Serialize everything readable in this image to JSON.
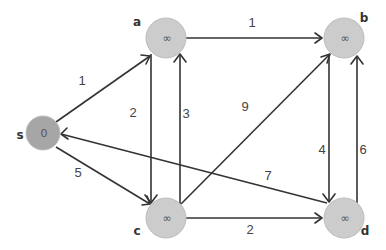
{
  "diagram": {
    "type": "directed-weighted-graph",
    "colors": {
      "source_node": "#a6a6a6",
      "node": "#cccccc",
      "edge": "#333333"
    },
    "nodes": [
      {
        "id": "s",
        "label": "s",
        "value": "0",
        "x": 43,
        "y": 133,
        "r": 17
      },
      {
        "id": "a",
        "label": "a",
        "value": "∞",
        "x": 166,
        "y": 38,
        "r": 20
      },
      {
        "id": "b",
        "label": "b",
        "value": "∞",
        "x": 344,
        "y": 38,
        "r": 20
      },
      {
        "id": "c",
        "label": "c",
        "value": "∞",
        "x": 166,
        "y": 218,
        "r": 20
      },
      {
        "id": "d",
        "label": "d",
        "value": "∞",
        "x": 344,
        "y": 218,
        "r": 20
      }
    ],
    "edges": [
      {
        "from": "s",
        "to": "a",
        "weight": "1"
      },
      {
        "from": "s",
        "to": "c",
        "weight": "5"
      },
      {
        "from": "a",
        "to": "b",
        "weight": "1"
      },
      {
        "from": "a",
        "to": "c",
        "weight": "2"
      },
      {
        "from": "c",
        "to": "a",
        "weight": "3"
      },
      {
        "from": "c",
        "to": "b",
        "weight": "9"
      },
      {
        "from": "c",
        "to": "d",
        "weight": "2"
      },
      {
        "from": "b",
        "to": "d",
        "weight": "4"
      },
      {
        "from": "d",
        "to": "b",
        "weight": "6"
      },
      {
        "from": "d",
        "to": "s",
        "weight": "7"
      }
    ]
  }
}
